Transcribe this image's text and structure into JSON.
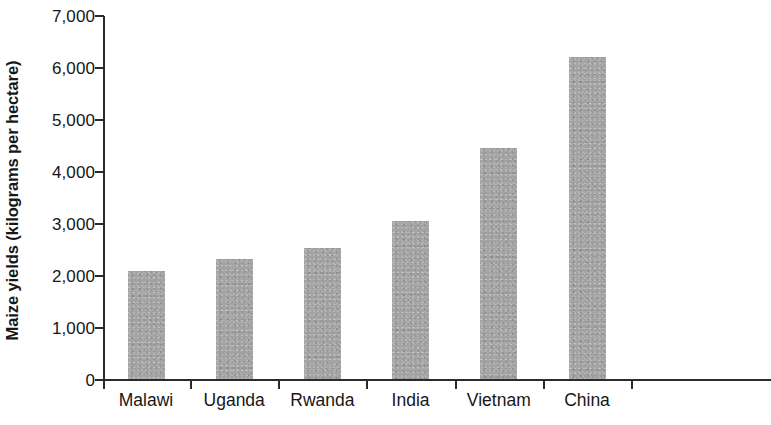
{
  "chart_data": {
    "type": "bar",
    "title": "",
    "subtitle": "",
    "xlabel": "",
    "ylabel": "Maize yields (kilograms per hectare)",
    "categories": [
      "Malawi",
      "Uganda",
      "Rwanda",
      "India",
      "Vietnam",
      "China"
    ],
    "values": [
      2080,
      2300,
      2520,
      3030,
      4450,
      6200
    ],
    "ylim": [
      0,
      7000
    ],
    "y_ticks": [
      0,
      1000,
      2000,
      3000,
      4000,
      5000,
      6000,
      7000
    ],
    "y_tick_labels": [
      "0",
      "1,000",
      "2,000",
      "3,000",
      "4,000",
      "5,000",
      "6,000",
      "7,000"
    ],
    "grid": false,
    "legend": null,
    "bar_color": "#a3a3a3",
    "axis_color": "#2b2b2b"
  }
}
